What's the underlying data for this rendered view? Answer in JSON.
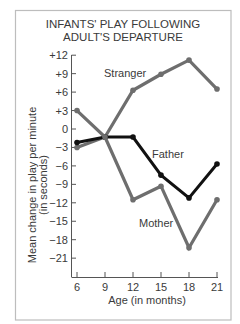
{
  "chart_data": {
    "type": "line",
    "title": "INFANTS' PLAY FOLLOWING ADULT'S DEPARTURE",
    "title_lines": [
      "INFANTS' PLAY FOLLOWING",
      "ADULT'S DEPARTURE"
    ],
    "xlabel": "Age (in months)",
    "ylabel": "Mean change in play per minute (in seconds)",
    "ylabel_lines": [
      "Mean change in play per minute",
      "(in seconds)"
    ],
    "x": [
      6,
      9,
      12,
      15,
      18,
      21
    ],
    "x_ticks": [
      "6",
      "9",
      "12",
      "15",
      "18",
      "21"
    ],
    "y_ticks": [
      12,
      9,
      6,
      3,
      0,
      -3,
      -6,
      -9,
      -12,
      -15,
      -18,
      -21
    ],
    "y_tick_labels": [
      "+12",
      "+9",
      "+6",
      "+3",
      "0",
      "−3",
      "−6",
      "−9",
      "−12",
      "−15",
      "−18",
      "−21"
    ],
    "xlim": [
      6,
      21
    ],
    "ylim": [
      -21,
      12
    ],
    "grid": false,
    "legend": "inline labels",
    "series": [
      {
        "name": "Stranger",
        "color": "#6e6e6e",
        "values": [
          -3,
          -1.3,
          6.3,
          8.9,
          11.2,
          6.5
        ]
      },
      {
        "name": "Father",
        "color": "#111111",
        "values": [
          -2.2,
          -1.3,
          -1.3,
          -7.5,
          -11.2,
          -5.7
        ]
      },
      {
        "name": "Mother",
        "color": "#6e6e6e",
        "values": [
          3,
          -1.3,
          -11.5,
          -9.3,
          -19.3,
          -11.5
        ]
      }
    ]
  }
}
